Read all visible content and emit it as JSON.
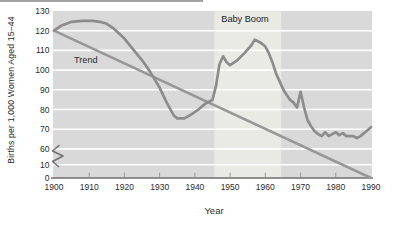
{
  "chart_data": {
    "type": "line",
    "title": "",
    "xlabel": "Year",
    "ylabel": "Births per 1,000 Women Aged 15–44",
    "xlim": [
      1900,
      1990
    ],
    "x_ticks": [
      1900,
      1910,
      1920,
      1930,
      1940,
      1950,
      1960,
      1970,
      1980,
      1990
    ],
    "y_ticks": [
      0,
      10,
      60,
      70,
      80,
      90,
      100,
      110,
      120,
      130
    ],
    "y_axis_break": {
      "between": [
        10,
        60
      ]
    },
    "grid": "horizontal-white-lines",
    "legend": "none",
    "series": [
      {
        "name": "Birth rate",
        "color": "#8c8c8c",
        "width": 2.7,
        "points": [
          [
            1900,
            120
          ],
          [
            1902,
            122.5
          ],
          [
            1905,
            124.5
          ],
          [
            1908,
            125
          ],
          [
            1911,
            125
          ],
          [
            1913,
            124.5
          ],
          [
            1915,
            123.5
          ],
          [
            1917,
            121
          ],
          [
            1920,
            116
          ],
          [
            1922,
            111.5
          ],
          [
            1925,
            105
          ],
          [
            1927,
            100
          ],
          [
            1930,
            91
          ],
          [
            1932,
            83.5
          ],
          [
            1934,
            77
          ],
          [
            1935,
            75.5
          ],
          [
            1937,
            75.5
          ],
          [
            1939,
            77.5
          ],
          [
            1941,
            80
          ],
          [
            1943,
            83
          ],
          [
            1945,
            85
          ],
          [
            1946,
            92
          ],
          [
            1947,
            103
          ],
          [
            1948,
            107
          ],
          [
            1949,
            104
          ],
          [
            1950,
            102.5
          ],
          [
            1952,
            105
          ],
          [
            1954,
            108.5
          ],
          [
            1956,
            112.5
          ],
          [
            1957,
            115.5
          ],
          [
            1958,
            114.5
          ],
          [
            1959,
            113.5
          ],
          [
            1960,
            112
          ],
          [
            1961,
            108.5
          ],
          [
            1962,
            104
          ],
          [
            1963,
            98.5
          ],
          [
            1964,
            94.5
          ],
          [
            1965,
            90.5
          ],
          [
            1966,
            87.5
          ],
          [
            1967,
            85
          ],
          [
            1968,
            83.5
          ],
          [
            1969,
            81
          ],
          [
            1970,
            89
          ],
          [
            1971,
            81
          ],
          [
            1972,
            74.5
          ],
          [
            1973,
            71.5
          ],
          [
            1974,
            69
          ],
          [
            1975,
            67.5
          ],
          [
            1976,
            66.5
          ],
          [
            1977,
            68.5
          ],
          [
            1978,
            66.5
          ],
          [
            1979,
            67.5
          ],
          [
            1980,
            68.5
          ],
          [
            1981,
            67
          ],
          [
            1982,
            68
          ],
          [
            1983,
            66.5
          ],
          [
            1984,
            66.5
          ],
          [
            1985,
            66.5
          ],
          [
            1986,
            65.5
          ],
          [
            1987,
            66.5
          ],
          [
            1988,
            68
          ],
          [
            1989,
            69.5
          ],
          [
            1990,
            71
          ]
        ]
      },
      {
        "name": "Trend",
        "color": "#979797",
        "width": 2.5,
        "points": [
          [
            1900,
            120
          ],
          [
            1990,
            58.5
          ]
        ]
      }
    ],
    "annotations": {
      "band": {
        "label": "Baby Boom",
        "from": 1945.5,
        "to": 1964.5,
        "color": "#eaeae5"
      },
      "trend_label": "Trend"
    },
    "colors": {
      "plot_bg": "#d9d9d9",
      "gridline": "#ffffff",
      "axis": "#6e6e6e",
      "tick": "#999999",
      "text": "#2b2b2b"
    }
  }
}
